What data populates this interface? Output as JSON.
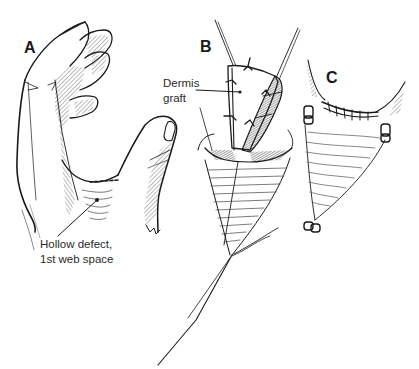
{
  "figure": {
    "panels": [
      {
        "id": "A",
        "label": "A"
      },
      {
        "id": "B",
        "label": "B"
      },
      {
        "id": "C",
        "label": "C"
      }
    ],
    "callouts": {
      "dermis_graft": {
        "line1": "Dermis",
        "line2": "graft"
      },
      "hollow_defect": {
        "line1": "Hollow defect,",
        "line2": "1st web space"
      }
    },
    "colors": {
      "ink": "#1a1a1a",
      "hatch": "#555555",
      "background": "#ffffff"
    }
  }
}
